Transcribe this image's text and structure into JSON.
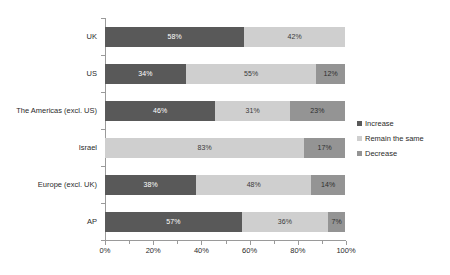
{
  "chart_data": {
    "type": "bar",
    "subtype": "stacked-horizontal-100",
    "title": "",
    "xlabel": "",
    "ylabel": "",
    "categories": [
      "UK",
      "US",
      "The Americas (excl. US)",
      "Israel",
      "Europe (excl. UK)",
      "AP"
    ],
    "series": [
      {
        "name": "Increase",
        "color": "#595959",
        "values": [
          58,
          34,
          46,
          0,
          38,
          57
        ],
        "labels": [
          "58%",
          "34%",
          "46%",
          "",
          "38%",
          "57%"
        ]
      },
      {
        "name": "Remain the same",
        "color": "#cfcfcf",
        "values": [
          42,
          55,
          31,
          83,
          48,
          36
        ],
        "labels": [
          "42%",
          "55%",
          "31%",
          "83%",
          "48%",
          "36%"
        ]
      },
      {
        "name": "Decrease",
        "color": "#949494",
        "values": [
          0,
          12,
          23,
          17,
          14,
          7
        ],
        "labels": [
          "",
          "12%",
          "23%",
          "17%",
          "14%",
          "7%"
        ]
      }
    ],
    "xlim": [
      0,
      100
    ],
    "xticks": [
      0,
      20,
      40,
      60,
      80,
      100
    ],
    "xticklabels": [
      "0%",
      "20%",
      "40%",
      "60%",
      "80%",
      "100%"
    ],
    "xminorticks": [
      10,
      30,
      50,
      70,
      90
    ],
    "grid": false,
    "legend": {
      "position": "right",
      "entries": [
        "Increase",
        "Remain the same",
        "Decrease"
      ]
    }
  },
  "legend": {
    "items": [
      {
        "label": "Increase",
        "swatch": "legend-swatch-increase"
      },
      {
        "label": "Remain the same",
        "swatch": "legend-swatch-remain-the-same"
      },
      {
        "label": "Decrease",
        "swatch": "legend-swatch-decrease"
      }
    ]
  }
}
